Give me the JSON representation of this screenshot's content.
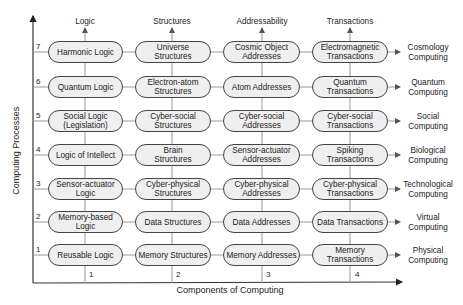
{
  "diagram": {
    "y_axis_label": "Computing Processes",
    "x_axis_label": "Components of Computing",
    "columns": [
      {
        "index": "1",
        "header": "Logic"
      },
      {
        "index": "2",
        "header": "Structures"
      },
      {
        "index": "3",
        "header": "Addressability"
      },
      {
        "index": "4",
        "header": "Transactions"
      }
    ],
    "rows": [
      {
        "index": "7",
        "cells": [
          "Harmonic Logic",
          "Universe\nStructures",
          "Cosmic Object\nAddresses",
          "Electromagnetic\nTransactions"
        ],
        "output": "Cosmology\nComputing"
      },
      {
        "index": "6",
        "cells": [
          "Quantum Logic",
          "Electron-atom\nStructures",
          "Atom Addresses",
          "Quantum\nTransactions"
        ],
        "output": "Quantum\nComputing"
      },
      {
        "index": "5",
        "cells": [
          "Social Logic\n(Legislation)",
          "Cyber-social\nStructures",
          "Cyber-social\nAddresses",
          "Cyber-social\nTransactions"
        ],
        "output": "Social\nComputing"
      },
      {
        "index": "4",
        "cells": [
          "Logic of Intellect",
          "Brain\nStructures",
          "Sensor-actuator\nAddresses",
          "Spiking\nTransactions"
        ],
        "output": "Biological\nComputing"
      },
      {
        "index": "3",
        "cells": [
          "Sensor-actuator\nLogic",
          "Cyber-physical\nStructures",
          "Cyber-physical\nAddresses",
          "Cyber-physical\nTransactions"
        ],
        "output": "Technological\nComputing"
      },
      {
        "index": "2",
        "cells": [
          "Memory-based\nLogic",
          "Data Structures",
          "Data Addresses",
          "Data Transactions"
        ],
        "output": "Virtual\nComputing"
      },
      {
        "index": "1",
        "cells": [
          "Reusable Logic",
          "Memory Structures",
          "Memory Addresses",
          "Memory Transactions"
        ],
        "output": "Physical\nComputing"
      }
    ]
  }
}
